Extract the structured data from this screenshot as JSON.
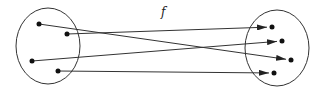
{
  "diagram": {
    "type": "function-mapping",
    "label": "f",
    "stroke_color": "#333333",
    "domain_set": {
      "ellipse": {
        "cx": 48,
        "cy": 46,
        "rx": 32,
        "ry": 38
      },
      "points": [
        {
          "id": "a1",
          "x": 39,
          "y": 24
        },
        {
          "id": "a2",
          "x": 67,
          "y": 34
        },
        {
          "id": "a3",
          "x": 32,
          "y": 61
        },
        {
          "id": "a4",
          "x": 58,
          "y": 71
        }
      ]
    },
    "codomain_set": {
      "ellipse": {
        "cx": 277,
        "cy": 48,
        "rx": 32,
        "ry": 38
      },
      "points": [
        {
          "id": "b1",
          "x": 272,
          "y": 27
        },
        {
          "id": "b2",
          "x": 282,
          "y": 41
        },
        {
          "id": "b3",
          "x": 291,
          "y": 60
        },
        {
          "id": "b4",
          "x": 274,
          "y": 73
        }
      ]
    },
    "mappings": [
      {
        "from": "a1",
        "to": "b3"
      },
      {
        "from": "a2",
        "to": "b1"
      },
      {
        "from": "a3",
        "to": "b2"
      },
      {
        "from": "a4",
        "to": "b4"
      }
    ]
  }
}
